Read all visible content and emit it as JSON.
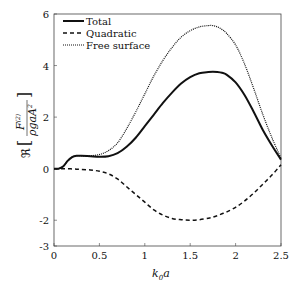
{
  "chart_data": {
    "type": "line",
    "title": "",
    "xlabel": "k_0 a",
    "ylabel": "Re[F^(2) / (rho g a A^2)]",
    "xlim": [
      0,
      2.5
    ],
    "ylim": [
      -3,
      6
    ],
    "xticks": [
      0,
      0.5,
      1,
      1.5,
      2,
      2.5
    ],
    "xtick_labels": [
      "0",
      "0.5",
      "1",
      "1.5",
      "2",
      "2.5"
    ],
    "yticks": [
      -3,
      -2,
      0,
      2,
      4,
      6
    ],
    "ytick_labels": [
      "-3",
      "-2",
      "0",
      "2",
      "4",
      "6"
    ],
    "grid": false,
    "legend_position": "upper left",
    "x": [
      0.05,
      0.1,
      0.15,
      0.2,
      0.25,
      0.3,
      0.4,
      0.5,
      0.6,
      0.7,
      0.8,
      0.9,
      1.0,
      1.1,
      1.2,
      1.3,
      1.4,
      1.5,
      1.6,
      1.7,
      1.75,
      1.8,
      1.85,
      1.9,
      2.0,
      2.1,
      2.2,
      2.3,
      2.4,
      2.5
    ],
    "series": [
      {
        "name": "Total",
        "style": "solid",
        "values": [
          0.0,
          0.08,
          0.3,
          0.45,
          0.5,
          0.5,
          0.48,
          0.46,
          0.48,
          0.6,
          0.85,
          1.2,
          1.65,
          2.1,
          2.55,
          2.95,
          3.3,
          3.55,
          3.7,
          3.75,
          3.76,
          3.75,
          3.72,
          3.65,
          3.35,
          2.85,
          2.2,
          1.5,
          0.9,
          0.35
        ]
      },
      {
        "name": "Quadratic",
        "style": "dashed",
        "values": [
          0.0,
          0.0,
          0.0,
          -0.01,
          -0.02,
          -0.03,
          -0.05,
          -0.1,
          -0.2,
          -0.4,
          -0.7,
          -1.0,
          -1.3,
          -1.6,
          -1.8,
          -1.93,
          -1.98,
          -2.0,
          -1.98,
          -1.92,
          -1.88,
          -1.82,
          -1.75,
          -1.68,
          -1.5,
          -1.25,
          -0.95,
          -0.6,
          -0.25,
          0.15
        ]
      },
      {
        "name": "Free surface",
        "style": "dotted",
        "values": [
          0.0,
          0.08,
          0.3,
          0.45,
          0.5,
          0.5,
          0.5,
          0.55,
          0.7,
          1.0,
          1.55,
          2.2,
          2.9,
          3.6,
          4.2,
          4.7,
          5.1,
          5.35,
          5.5,
          5.55,
          5.55,
          5.5,
          5.4,
          5.25,
          4.8,
          4.05,
          3.1,
          2.1,
          1.2,
          0.4
        ]
      }
    ]
  },
  "legend": {
    "items": [
      "Total",
      "Quadratic",
      "Free surface"
    ]
  },
  "axes": {
    "xlabel_main": "k",
    "xlabel_sub": "0",
    "xlabel_tail": "a",
    "ylabel_prefix": "ℜ",
    "ylabel_num": "F",
    "ylabel_num_sup": "(2)",
    "ylabel_den": "ρgaA",
    "ylabel_den_sup": "2"
  }
}
